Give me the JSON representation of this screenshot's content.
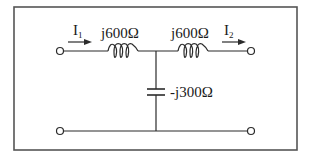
{
  "diagram": {
    "type": "two-port T-network circuit",
    "colors": {
      "line": "#2b2b2b",
      "border": "#555555",
      "background": "#ffffff"
    },
    "currents": [
      {
        "id": "I1",
        "symbol": "I",
        "subscript": "1",
        "direction": "right"
      },
      {
        "id": "I2",
        "symbol": "I",
        "subscript": "2",
        "direction": "right"
      }
    ],
    "components": [
      {
        "id": "L1",
        "kind": "inductor",
        "label": "j600Ω",
        "position": "series-left"
      },
      {
        "id": "L2",
        "kind": "inductor",
        "label": "j600Ω",
        "position": "series-right"
      },
      {
        "id": "C1",
        "kind": "capacitor",
        "label": "-j300Ω",
        "position": "shunt"
      }
    ],
    "terminals": [
      "top-left",
      "top-right",
      "bottom-left",
      "bottom-right"
    ]
  }
}
